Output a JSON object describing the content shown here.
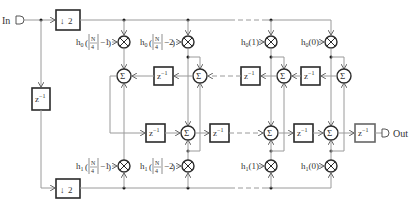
{
  "diagram": {
    "input_label": "In",
    "output_label": "Out",
    "downsample_label": "2",
    "delay_label": "z",
    "delay_exp": "−1",
    "sum_symbol": "Σ",
    "mult_symbol": "×",
    "top_coefficients": [
      {
        "prefix": "h",
        "sub": "0",
        "arg_num": "N",
        "arg_den": "4",
        "arg_suffix": "−1"
      },
      {
        "prefix": "h",
        "sub": "0",
        "arg_num": "N",
        "arg_den": "4",
        "arg_suffix": "−2"
      },
      {
        "prefix": "h",
        "sub": "0",
        "arg": "(1)"
      },
      {
        "prefix": "h",
        "sub": "0",
        "arg": "(0)"
      }
    ],
    "bottom_coefficients": [
      {
        "prefix": "h",
        "sub": "1",
        "arg_num": "N",
        "arg_den": "4",
        "arg_suffix": "−1"
      },
      {
        "prefix": "h",
        "sub": "1",
        "arg_num": "N",
        "arg_den": "4",
        "arg_suffix": "−2"
      },
      {
        "prefix": "h",
        "sub": "1",
        "arg": "(1)"
      },
      {
        "prefix": "h",
        "sub": "1",
        "arg": "(0)"
      }
    ],
    "colors": {
      "wire": "#9a9a9a",
      "block_border": "#2a2a2a",
      "text": "#333333"
    }
  }
}
